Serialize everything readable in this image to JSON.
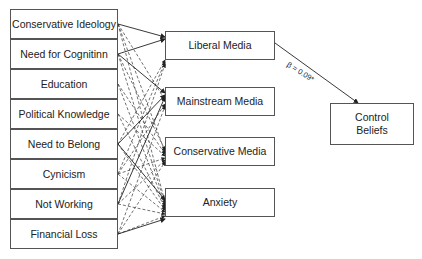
{
  "diagram": {
    "type": "path-model",
    "predictors": [
      {
        "label": "Conservative Ideology"
      },
      {
        "label": "Need for Cognitinn"
      },
      {
        "label": "Education"
      },
      {
        "label": "Political Knowledge"
      },
      {
        "label": "Need to Belong"
      },
      {
        "label": "Cynicism"
      },
      {
        "label": "Not Working"
      },
      {
        "label": "Financial Loss"
      }
    ],
    "mediators": [
      {
        "label": "Liberal Media"
      },
      {
        "label": "Mainstream Media"
      },
      {
        "label": "Conservative Media"
      },
      {
        "label": "Anxiety"
      }
    ],
    "outcome": {
      "label_line1": "Control",
      "label_line2": "Beliefs"
    },
    "coefficient_label": "β = 0.09*",
    "edges": {
      "solid": [
        [
          "Conservative Ideology",
          "Liberal Media"
        ],
        [
          "Need for Cognitinn",
          "Liberal Media"
        ],
        [
          "Need for Cognitinn",
          "Mainstream Media"
        ],
        [
          "Need to Belong",
          "Mainstream Media"
        ],
        [
          "Need to Belong",
          "Anxiety"
        ],
        [
          "Not Working",
          "Mainstream Media"
        ],
        [
          "Financial Loss",
          "Anxiety"
        ],
        [
          "Liberal Media",
          "Control Beliefs"
        ]
      ],
      "dashed_note": "Dashed arrows connect the remaining predictors to mediators"
    }
  }
}
